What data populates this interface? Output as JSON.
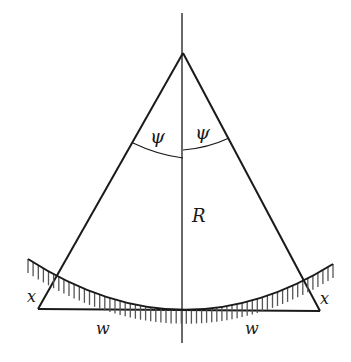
{
  "diagram": {
    "labels": {
      "psi_left": "ψ",
      "psi_right": "ψ",
      "radius": "R",
      "x_left": "x",
      "x_right": "x",
      "w_left": "w",
      "w_right": "w"
    },
    "colors": {
      "line": "#1a1a1a",
      "hatch": "#555555",
      "background": "#ffffff"
    }
  }
}
